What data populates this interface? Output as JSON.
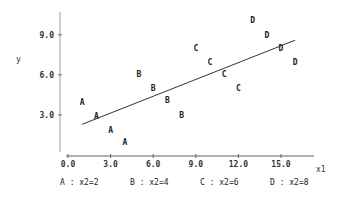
{
  "chart_data": {
    "type": "scatter",
    "title": "",
    "xlabel": "x1",
    "ylabel": "y",
    "xlim": [
      0,
      17
    ],
    "ylim": [
      0,
      11
    ],
    "x_ticks": [
      "0.0",
      "3.0",
      "6.0",
      "9.0",
      "12.0",
      "15.0"
    ],
    "y_ticks": [
      "3.0",
      "6.0",
      "9.0"
    ],
    "grid": false,
    "legend_position": "bottom",
    "series": [
      {
        "name": "A",
        "label": "A : x2=2",
        "x": [
          1,
          2,
          3,
          4
        ],
        "y": [
          4.0,
          2.9,
          1.9,
          1.0
        ]
      },
      {
        "name": "B",
        "label": "B : x2=4",
        "x": [
          5,
          6,
          7,
          8
        ],
        "y": [
          6.1,
          5.0,
          4.1,
          3.0
        ]
      },
      {
        "name": "C",
        "label": "C : x2=6",
        "x": [
          9,
          10,
          11,
          12
        ],
        "y": [
          8.0,
          7.0,
          6.1,
          5.0
        ]
      },
      {
        "name": "D",
        "label": "D : x2=8",
        "x": [
          13,
          14,
          15,
          16
        ],
        "y": [
          10.1,
          9.0,
          8.0,
          7.0
        ]
      }
    ],
    "fit_line": {
      "x": [
        1.0,
        16.0
      ],
      "y": [
        2.3,
        8.6
      ]
    }
  },
  "legend": {
    "a": "A : x2=2",
    "b": "B : x2=4",
    "c": "C : x2=6",
    "d": "D : x2=8"
  },
  "axes": {
    "xlabel": "x1",
    "ylabel": "y",
    "x_ticks": [
      "0.0",
      "3.0",
      "6.0",
      "9.0",
      "12.0",
      "15.0"
    ],
    "y_ticks": [
      "3.0",
      "6.0",
      "9.0"
    ]
  },
  "colors": {
    "axis": "#888888",
    "line": "#333333",
    "text": "#222222"
  }
}
